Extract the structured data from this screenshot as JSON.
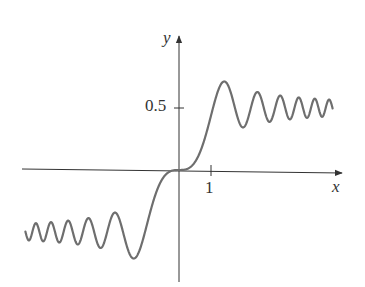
{
  "chart_data": {
    "type": "line",
    "title": "",
    "function": "S(x) = integral from 0 to x of sin(pi t^2 / 2) dt (Fresnel sine integral)",
    "xlabel": "x",
    "ylabel": "y",
    "x_ticks": [
      {
        "value": 1,
        "label": "1"
      }
    ],
    "y_ticks": [
      {
        "value": 0.5,
        "label": "0.5"
      }
    ],
    "xlim": [
      -4.9,
      5.0
    ],
    "ylim": [
      -0.9,
      1.1
    ],
    "grid": false,
    "legend": null,
    "series": [
      {
        "name": "S(x)",
        "color": "#6e6e6e",
        "x": [
          -4.8,
          -4.0,
          -3.0,
          -2.0,
          -1.5,
          -1.22,
          -1.0,
          -0.5,
          0,
          0.5,
          1.0,
          1.22,
          1.5,
          2.0,
          2.35,
          3.0,
          4.0,
          4.8
        ],
        "y": [
          -0.43,
          -0.42,
          -0.5,
          -0.34,
          -0.7,
          -0.71,
          -0.44,
          -0.06,
          0,
          0.06,
          0.44,
          0.71,
          0.7,
          0.34,
          0.62,
          0.5,
          0.42,
          0.43
        ]
      }
    ]
  },
  "axes": {
    "x_label": "x",
    "y_label": "y",
    "x_tick_label": "1",
    "y_tick_label": "0.5",
    "axis_color": "#333333",
    "curve_color": "#6e6e6e"
  }
}
